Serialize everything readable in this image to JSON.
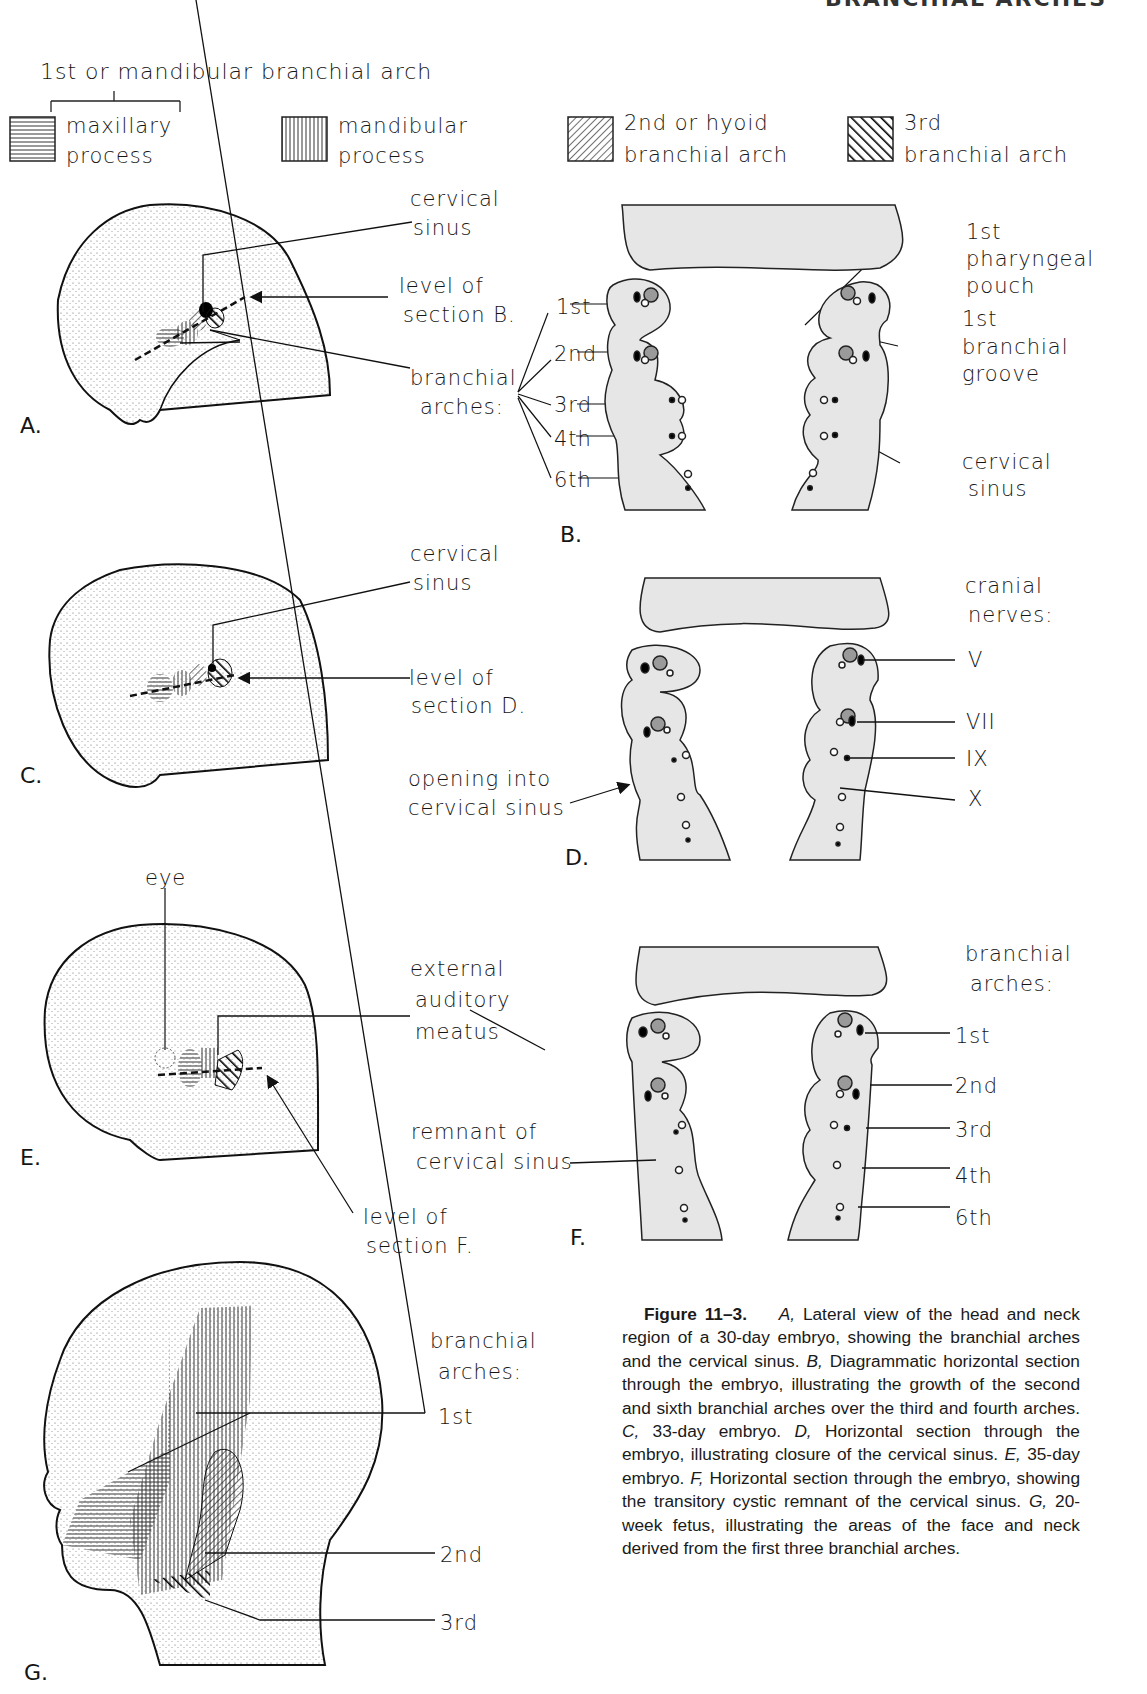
{
  "running_header": "BRANCHIAL ARCHES",
  "legend": {
    "group_title": "1st or mandibular branchial arch",
    "items": [
      {
        "pattern": "horizontal-lines",
        "line1": "maxillary",
        "line2": "process"
      },
      {
        "pattern": "vertical-lines",
        "line1": "mandibular",
        "line2": "process"
      },
      {
        "pattern": "fine-diagonal-lines",
        "line1": "2nd or hyoid",
        "line2": "branchial arch"
      },
      {
        "pattern": "bold-diagonal-lines",
        "line1": "3rd",
        "line2": "branchial arch"
      }
    ]
  },
  "panels": {
    "A": {
      "letter": "A.",
      "labels": {
        "cervical_sinus_1": "cervical",
        "cervical_sinus_2": "sinus",
        "level_1": "level of",
        "level_2": "section B.",
        "arches_1": "branchial",
        "arches_2": "arches:"
      }
    },
    "B": {
      "letter": "B.",
      "arch_labels": [
        "1st",
        "2nd",
        "3rd",
        "4th",
        "6th"
      ],
      "right_labels": {
        "pouch_1": "1st",
        "pouch_2": "pharyngeal",
        "pouch_3": "pouch",
        "groove_1": "1st",
        "groove_2": "branchial",
        "groove_3": "groove",
        "sinus_1": "cervical",
        "sinus_2": "sinus"
      }
    },
    "C": {
      "letter": "C.",
      "labels": {
        "cervical_sinus_1": "cervical",
        "cervical_sinus_2": "sinus",
        "level_1": "level of",
        "level_2": "section D."
      }
    },
    "D": {
      "letter": "D.",
      "left_labels": {
        "opening_1": "opening into",
        "opening_2": "cervical sinus"
      },
      "nerves_title_1": "cranial",
      "nerves_title_2": "nerves:",
      "nerves": [
        "V",
        "VII",
        "IX",
        "X"
      ]
    },
    "E": {
      "letter": "E.",
      "labels": {
        "eye": "eye",
        "meatus_1": "external",
        "meatus_2": "auditory",
        "meatus_3": "meatus",
        "level_1": "level of",
        "level_2": "section F."
      }
    },
    "F": {
      "letter": "F.",
      "left_labels": {
        "remnant_1": "remnant of",
        "remnant_2": "cervical sinus"
      },
      "arches_title_1": "branchial",
      "arches_title_2": "arches:",
      "arch_labels": [
        "1st",
        "2nd",
        "3rd",
        "4th",
        "6th"
      ]
    },
    "G": {
      "letter": "G.",
      "arches_title_1": "branchial",
      "arches_title_2": "arches:",
      "arch_labels": [
        "1st",
        "2nd",
        "3rd"
      ]
    }
  },
  "caption": {
    "figure_label": "Figure 11–3.",
    "text_parts": [
      {
        "italic": "A,"
      },
      {
        "plain": " Lateral view of the head and neck region of a 30-day embryo, showing the branchial arches and the cervical sinus. "
      },
      {
        "italic": "B,"
      },
      {
        "plain": " Diagrammatic horizontal section through the embryo, illustrating the growth of the second and sixth branchial arches over the third and fourth arches. "
      },
      {
        "italic": "C,"
      },
      {
        "plain": " 33-day embryo. "
      },
      {
        "italic": "D,"
      },
      {
        "plain": " Horizontal section through the embryo, illustrating closure of the cervical sinus. "
      },
      {
        "italic": "E,"
      },
      {
        "plain": " 35-day embryo. "
      },
      {
        "italic": "F,"
      },
      {
        "plain": " Horizontal section through the embryo, showing the transitory cystic remnant of the cervical sinus. "
      },
      {
        "italic": "G,"
      },
      {
        "plain": " 20-week fetus, illustrating the areas of the face and neck derived from the first three branchial arches."
      }
    ]
  },
  "colors": {
    "ink": "#151515",
    "section_fill": "#e6e6e6",
    "ganglion_fill": "#9a9a9a",
    "paper": "#ffffff"
  }
}
